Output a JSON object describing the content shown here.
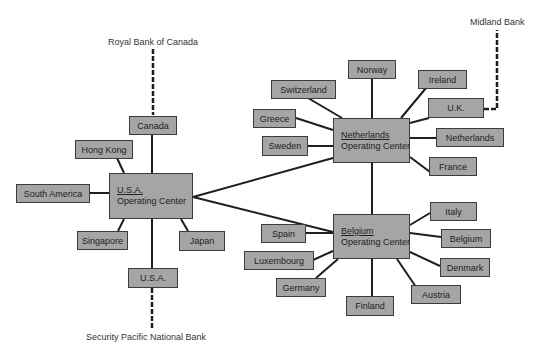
{
  "diagram": {
    "type": "network",
    "hubs": [
      {
        "id": "usa_oc",
        "name": "U.S.A.",
        "subtitle": "Operating Center"
      },
      {
        "id": "nl_oc",
        "name": "Netherlands",
        "subtitle": "Operating Center"
      },
      {
        "id": "be_oc",
        "name": "Belgium",
        "subtitle": "Operating Center"
      }
    ],
    "usa_nodes": [
      "Canada",
      "Hong Kong",
      "South America",
      "Singapore",
      "U.S.A.",
      "Japan"
    ],
    "nl_nodes": [
      "Norway",
      "Switzerland",
      "Ireland",
      "U.K.",
      "Greece",
      "Netherlands",
      "Sweden",
      "France"
    ],
    "be_nodes": [
      "Italy",
      "Spain",
      "Belgium",
      "Luxembourg",
      "Denmark",
      "Germany",
      "Austria",
      "Finland"
    ],
    "banks": [
      {
        "name": "Royal Bank of Canada",
        "connects_to": "Canada"
      },
      {
        "name": "Midland Bank",
        "connects_to": "U.K."
      },
      {
        "name": "Security Pacific National Bank",
        "connects_to": "U.S.A."
      }
    ],
    "hub_links": [
      [
        "usa_oc",
        "nl_oc"
      ],
      [
        "usa_oc",
        "be_oc"
      ],
      [
        "nl_oc",
        "be_oc"
      ]
    ]
  },
  "labels": {
    "usa_name": "U.S.A.",
    "usa_sub": "Operating Center",
    "nl_name": "Netherlands",
    "nl_sub": "Operating Center",
    "be_name": "Belgium",
    "be_sub": "Operating Center",
    "canada": "Canada",
    "hong_kong": "Hong Kong",
    "south_america": "South America",
    "singapore": "Singapore",
    "usa": "U.S.A.",
    "japan": "Japan",
    "norway": "Norway",
    "switzerland": "Switzerland",
    "ireland": "Ireland",
    "uk": "U.K.",
    "greece": "Greece",
    "netherlands": "Netherlands",
    "sweden": "Sweden",
    "france": "France",
    "italy": "Italy",
    "spain": "Spain",
    "belgium": "Belgium",
    "luxembourg": "Luxembourg",
    "denmark": "Denmark",
    "germany": "Germany",
    "austria": "Austria",
    "finland": "Finland",
    "bank_rbc": "Royal Bank of Canada",
    "bank_midland": "Midland Bank",
    "bank_spnb": "Security Pacific National Bank"
  },
  "colors": {
    "box_fill": "#a5a5a5",
    "border": "#3c3c3c",
    "line": "#1e1e1e"
  }
}
